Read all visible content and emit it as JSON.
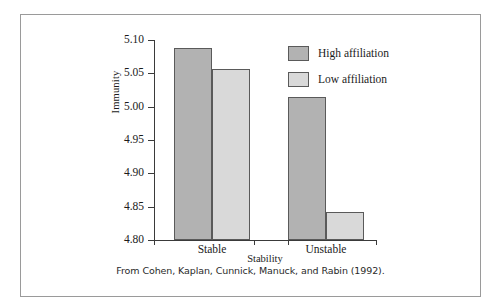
{
  "figure": {
    "caption": "From Cohen, Kaplan, Cunnick, Manuck, and Rabin (1992)."
  },
  "colors": {
    "high_affiliation": "#b2b2b2",
    "low_affiliation": "#d9d9d9",
    "bar_border": "#5a5a5a",
    "axis": "#3a3a3a",
    "frame": "#9a9a9a",
    "text": "#1b1b1b"
  },
  "chart_data": {
    "type": "bar",
    "title": "",
    "xlabel": "Stability",
    "ylabel": "Immunity",
    "categories": [
      "Stable",
      "Unstable"
    ],
    "series": [
      {
        "name": "High affiliation",
        "values": [
          5.088,
          5.015
        ],
        "color": "#b2b2b2"
      },
      {
        "name": "Low affiliation",
        "values": [
          5.057,
          4.842
        ],
        "color": "#d9d9d9"
      }
    ],
    "ylim": [
      4.8,
      5.1
    ],
    "yticks": [
      4.8,
      4.85,
      4.9,
      4.95,
      5.0,
      5.05,
      5.1
    ],
    "ytick_labels": [
      "4.80",
      "4.85",
      "4.90",
      "4.95",
      "5.00",
      "5.05",
      "5.10"
    ],
    "grid": false,
    "legend_position": "top-right"
  }
}
